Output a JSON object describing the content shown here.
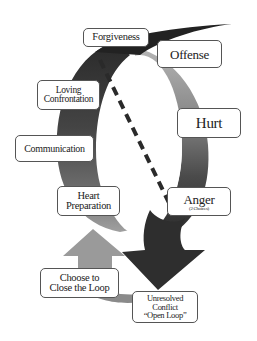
{
  "diagram": {
    "type": "cycle",
    "colors": {
      "background": "#ffffff",
      "ring_dark": "#3a3a3a",
      "ring_mid": "#6e6e6e",
      "ring_light": "#a8a8a8",
      "arrow_up": "#9a9a9a",
      "arrow_down": "#2e2e2e",
      "dashed_line": "#2a2a2a",
      "label_border": "#555555"
    },
    "nodes": {
      "forgiveness": {
        "label": "Forgiveness"
      },
      "offense": {
        "label": "Offense"
      },
      "hurt": {
        "label": "Hurt"
      },
      "anger": {
        "label": "Anger",
        "sublabel": "(2 Choices)"
      },
      "loving_confrontation": {
        "line1": "Loving",
        "line2": "Confrontation"
      },
      "communication": {
        "label": "Communication"
      },
      "heart_preparation": {
        "line1": "Heart",
        "line2": "Preparation"
      },
      "choose_to_close": {
        "line1": "Choose to",
        "line2": "Close the Loop"
      },
      "unresolved_conflict": {
        "line1": "Unresolved",
        "line2": "Conflict",
        "line3": "“Open Loop”"
      }
    },
    "edges": [
      {
        "from": "Offense",
        "to": "Hurt"
      },
      {
        "from": "Hurt",
        "to": "Anger"
      },
      {
        "from": "Anger",
        "to": "Unresolved Conflict “Open Loop”",
        "style": "down-arrow"
      },
      {
        "from": "Unresolved Conflict “Open Loop”",
        "to": "Choose to Close the Loop"
      },
      {
        "from": "Choose to Close the Loop",
        "to": "Heart Preparation",
        "style": "up-arrow"
      },
      {
        "from": "Heart Preparation",
        "to": "Communication"
      },
      {
        "from": "Communication",
        "to": "Loving Confrontation"
      },
      {
        "from": "Loving Confrontation",
        "to": "Forgiveness"
      },
      {
        "from": "Forgiveness",
        "to": "Offense"
      },
      {
        "from": "Forgiveness",
        "to": "Anger",
        "style": "dashed"
      }
    ]
  }
}
